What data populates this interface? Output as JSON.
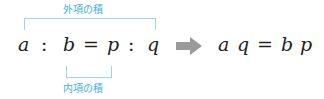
{
  "labels": {
    "outer_product": "外項の積",
    "inner_product": "内項の積"
  },
  "left_equation": {
    "terms": [
      "a",
      ":",
      "b",
      "=",
      "p",
      ":",
      "q"
    ]
  },
  "right_equation": {
    "terms": [
      "a",
      "q",
      "=",
      "b",
      "p"
    ]
  },
  "colors": {
    "label": "#3fb0e0",
    "bracket": "#9fd6ef",
    "arrow": "#999999",
    "text": "#222222"
  },
  "icons": {
    "arrow": "right-arrow"
  }
}
